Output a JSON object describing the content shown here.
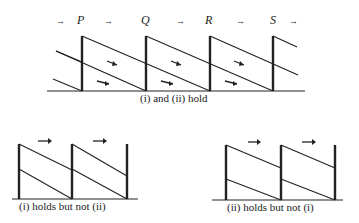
{
  "top_diagram": {
    "letters": [
      "P",
      "Q",
      "R",
      "S"
    ],
    "caption": "(i) and (ii) hold",
    "arrow_glyph": "→"
  },
  "bottom_left": {
    "caption": "(i) holds but not (ii)"
  },
  "bottom_right": {
    "caption": "(ii) holds but not (i)"
  }
}
